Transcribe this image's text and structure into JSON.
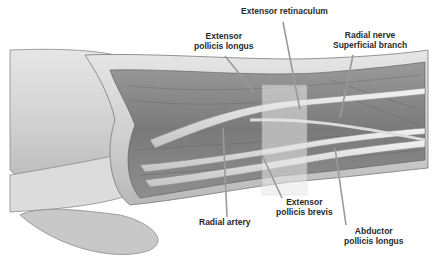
{
  "figure": {
    "style": "grayscale anatomical illustration"
  },
  "labels": [
    {
      "id": "extensor-retinaculum",
      "text": "Extensor retinaculum"
    },
    {
      "id": "extensor-pollicis-longus",
      "line1": "Extensor",
      "line2": "pollicis longus"
    },
    {
      "id": "radial-nerve-superficial-branch",
      "line1": "Radial nerve",
      "line2": "Superficial branch"
    },
    {
      "id": "radial-artery",
      "text": "Radial artery"
    },
    {
      "id": "extensor-pollicis-brevis",
      "line1": "Extensor",
      "line2": "pollicis brevis"
    },
    {
      "id": "abductor-pollicis-longus",
      "line1": "Abductor",
      "line2": "pollicis longus"
    }
  ],
  "colors": {
    "background": "#ffffff",
    "label_text": "#2a2a2a",
    "leader_line": "#9a9a9a"
  }
}
